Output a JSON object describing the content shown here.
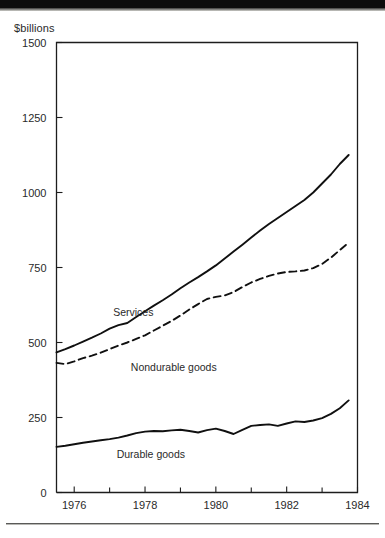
{
  "figure": {
    "y_axis_title": "$billions",
    "y_ticks": [
      "0",
      "250",
      "500",
      "750",
      "1000",
      "1250",
      "1500"
    ],
    "x_ticks": [
      "1976",
      "1978",
      "1980",
      "1982",
      "1984"
    ],
    "series_labels": {
      "services": "Services",
      "nondurable": "Nondurable goods",
      "durable": "Durable goods"
    },
    "colors": {
      "ink": "#101010",
      "axis": "#1d1d1d",
      "paper": "#ffffff",
      "top_band": "#0d0d0d"
    }
  },
  "chart_data": {
    "type": "line",
    "title": "",
    "subtitle": "",
    "xlabel": "",
    "ylabel": "$billions",
    "xlim": [
      1975.5,
      1984.0
    ],
    "ylim": [
      0,
      1500
    ],
    "grid": false,
    "legend": "inline-annotations",
    "x_tick_values": [
      1976,
      1978,
      1980,
      1982,
      1984
    ],
    "x_minor_tick_values": [
      1977,
      1979,
      1981,
      1983
    ],
    "y_tick_values": [
      0,
      250,
      500,
      750,
      1000,
      1250,
      1500
    ],
    "x": [
      1975.5,
      1975.75,
      1976.0,
      1976.25,
      1976.5,
      1976.75,
      1977.0,
      1977.25,
      1977.5,
      1977.75,
      1978.0,
      1978.25,
      1978.5,
      1978.75,
      1979.0,
      1979.25,
      1979.5,
      1979.75,
      1980.0,
      1980.25,
      1980.5,
      1980.75,
      1981.0,
      1981.25,
      1981.5,
      1981.75,
      1982.0,
      1982.25,
      1982.5,
      1982.75,
      1983.0,
      1983.25,
      1983.5,
      1983.75
    ],
    "series": [
      {
        "name": "Services",
        "style": "solid",
        "values": [
          467,
          478,
          490,
          503,
          516,
          530,
          546,
          558,
          565,
          585,
          604,
          623,
          641,
          660,
          681,
          700,
          718,
          737,
          757,
          780,
          803,
          826,
          850,
          873,
          895,
          915,
          935,
          955,
          975,
          1000,
          1030,
          1060,
          1095,
          1125
        ]
      },
      {
        "name": "Nondurable goods",
        "style": "dashed",
        "values": [
          432,
          428,
          437,
          448,
          456,
          466,
          478,
          490,
          500,
          512,
          524,
          540,
          556,
          572,
          590,
          610,
          628,
          645,
          652,
          657,
          668,
          685,
          700,
          712,
          722,
          730,
          735,
          737,
          740,
          748,
          762,
          783,
          808,
          833
        ]
      },
      {
        "name": "Durable goods",
        "style": "solid",
        "values": [
          152,
          156,
          161,
          166,
          170,
          174,
          178,
          183,
          190,
          198,
          203,
          205,
          204,
          207,
          209,
          205,
          200,
          208,
          213,
          205,
          195,
          209,
          222,
          225,
          227,
          222,
          230,
          237,
          235,
          240,
          248,
          262,
          281,
          307
        ]
      }
    ],
    "annotations": [
      {
        "text": "Services",
        "x": 1977.1,
        "y": 590
      },
      {
        "text": "Nondurable goods",
        "x": 1977.6,
        "y": 405
      },
      {
        "text": "Durable goods",
        "x": 1977.2,
        "y": 115
      }
    ]
  }
}
